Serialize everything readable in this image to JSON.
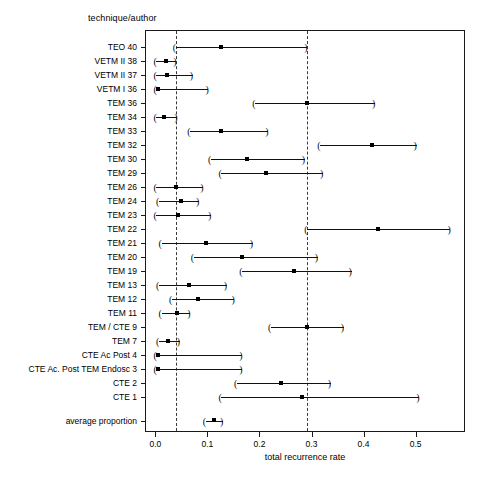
{
  "chart_data": {
    "type": "scatter",
    "plot_style": "forest-plot",
    "title": "",
    "header_label": "technique/author",
    "xlabel": "total recurrence rate",
    "ylabel": "",
    "xlim": [
      -0.02,
      0.595
    ],
    "xticks": [
      0.0,
      0.1,
      0.2,
      0.3,
      0.4,
      0.5
    ],
    "xticklabels": [
      "0.0",
      "0.1",
      "0.2",
      "0.3",
      "0.4",
      "0.5"
    ],
    "grid": false,
    "legend": null,
    "reference_lines": [
      0.037,
      0.29
    ],
    "reference_line_style": "dashed",
    "marker": "filled-square",
    "categories": [
      "TEO 40",
      "VETM II 38",
      "VETM II 37",
      "VETM I 36",
      "TEM 36",
      "TEM 34",
      "TEM 33",
      "TEM 32",
      "TEM 30",
      "TEM 29",
      "TEM 26",
      "TEM 24",
      "TEM 23",
      "TEM 22",
      "TEM 21",
      "TEM 20",
      "TEM 19",
      "TEM 13",
      "TEM 12",
      "TEM 11",
      "TEM / CTE 9",
      "TEM 7",
      "CTE Ac Post 4",
      "CTE Ac. Post TEM Endosc 3",
      "CTE 2",
      "CTE 1",
      "average proportion"
    ],
    "points": [
      {
        "label": "TEO 40",
        "value": 0.125,
        "low": 0.037,
        "high": 0.29,
        "row": 0
      },
      {
        "label": "VETM II 38",
        "value": 0.018,
        "low": 0.0,
        "high": 0.038,
        "row": 1
      },
      {
        "label": "VETM II 37",
        "value": 0.02,
        "low": 0.0,
        "high": 0.07,
        "row": 2
      },
      {
        "label": "VETM I 36",
        "value": 0.003,
        "low": 0.0,
        "high": 0.1,
        "row": 3
      },
      {
        "label": "TEM 36",
        "value": 0.29,
        "low": 0.19,
        "high": 0.42,
        "row": 4
      },
      {
        "label": "TEM 34",
        "value": 0.014,
        "low": 0.0,
        "high": 0.04,
        "row": 5
      },
      {
        "label": "TEM 33",
        "value": 0.125,
        "low": 0.065,
        "high": 0.215,
        "row": 6
      },
      {
        "label": "TEM 32",
        "value": 0.415,
        "low": 0.315,
        "high": 0.5,
        "row": 7
      },
      {
        "label": "TEM 30",
        "value": 0.175,
        "low": 0.105,
        "high": 0.285,
        "row": 8
      },
      {
        "label": "TEM 29",
        "value": 0.21,
        "low": 0.125,
        "high": 0.32,
        "row": 9
      },
      {
        "label": "TEM 26",
        "value": 0.037,
        "low": 0.0,
        "high": 0.09,
        "row": 10
      },
      {
        "label": "TEM 24",
        "value": 0.048,
        "low": 0.005,
        "high": 0.082,
        "row": 11
      },
      {
        "label": "TEM 23",
        "value": 0.042,
        "low": 0.0,
        "high": 0.105,
        "row": 12
      },
      {
        "label": "TEM 22",
        "value": 0.425,
        "low": 0.29,
        "high": 0.565,
        "row": 13
      },
      {
        "label": "TEM 21",
        "value": 0.095,
        "low": 0.01,
        "high": 0.185,
        "row": 14
      },
      {
        "label": "TEM 20",
        "value": 0.165,
        "low": 0.072,
        "high": 0.31,
        "row": 15
      },
      {
        "label": "TEM 19",
        "value": 0.265,
        "low": 0.165,
        "high": 0.375,
        "row": 16
      },
      {
        "label": "TEM 13",
        "value": 0.062,
        "low": 0.005,
        "high": 0.135,
        "row": 17
      },
      {
        "label": "TEM 12",
        "value": 0.08,
        "low": 0.03,
        "high": 0.15,
        "row": 18
      },
      {
        "label": "TEM 11",
        "value": 0.04,
        "low": 0.01,
        "high": 0.065,
        "row": 19
      },
      {
        "label": "TEM / CTE 9",
        "value": 0.29,
        "low": 0.22,
        "high": 0.36,
        "row": 20
      },
      {
        "label": "TEM 7",
        "value": 0.022,
        "low": 0.005,
        "high": 0.045,
        "row": 21
      },
      {
        "label": "CTE Ac Post 4",
        "value": 0.003,
        "low": 0.0,
        "high": 0.165,
        "row": 22
      },
      {
        "label": "CTE Ac. Post TEM Endosc 3",
        "value": 0.003,
        "low": 0.0,
        "high": 0.165,
        "row": 23
      },
      {
        "label": "CTE 2",
        "value": 0.24,
        "low": 0.155,
        "high": 0.335,
        "row": 24
      },
      {
        "label": "CTE 1",
        "value": 0.28,
        "low": 0.125,
        "high": 0.505,
        "row": 25
      },
      {
        "label": "average proportion",
        "value": 0.11,
        "low": 0.095,
        "high": 0.128,
        "row": 26.7
      }
    ]
  }
}
